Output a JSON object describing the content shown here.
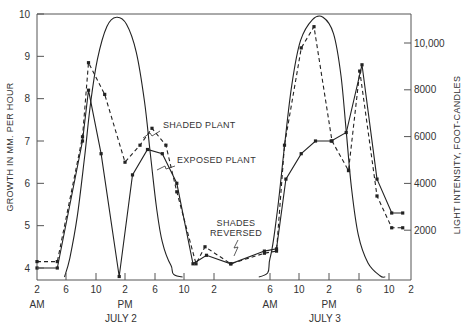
{
  "chart_data": {
    "type": "line",
    "title": "",
    "ylabel": "GROWTH IN MM. PER HOUR",
    "y2label": "LIGHT INTENSITY, FOOT-CANDLES",
    "ylim": [
      4,
      10
    ],
    "y2lim": [
      0,
      11500
    ],
    "yticks": [
      4,
      5,
      6,
      7,
      8,
      9,
      10
    ],
    "y2ticks": [
      {
        "value": 2000,
        "label": "2000"
      },
      {
        "value": 4000,
        "label": "4000"
      },
      {
        "value": 6000,
        "label": "6000"
      },
      {
        "value": 8000,
        "label": "8000"
      },
      {
        "value": 10000,
        "label": "10,000"
      }
    ],
    "xticks": [
      {
        "t": 0,
        "label": "2"
      },
      {
        "t": 4,
        "label": "6"
      },
      {
        "t": 8,
        "label": "10"
      },
      {
        "t": 12,
        "label": "2"
      },
      {
        "t": 16,
        "label": "6"
      },
      {
        "t": 20,
        "label": "10"
      },
      {
        "t": 24,
        "label": "2"
      },
      {
        "t": 28,
        "label": "6"
      },
      {
        "t": 32,
        "label": "10"
      },
      {
        "t": 36,
        "label": "2"
      },
      {
        "t": 40,
        "label": "6"
      },
      {
        "t": 44,
        "label": "10"
      },
      {
        "t": 48,
        "label": "2"
      }
    ],
    "x_sublabels": [
      {
        "t": 0,
        "label": "AM"
      },
      {
        "t": 12,
        "label": "PM"
      },
      {
        "t": 28,
        "label": "AM"
      },
      {
        "t": 36,
        "label": "PM"
      }
    ],
    "x_daylabels": [
      {
        "t": 12,
        "label": "JULY 2"
      },
      {
        "t": 36,
        "label": "JULY 3"
      }
    ],
    "xlabel_units": "hours from 2 AM July 2",
    "grid": false,
    "series": [
      {
        "name": "EXPOSED PLANT",
        "axis": "left",
        "style": "solid",
        "markers": true,
        "points": [
          [
            0,
            4.0
          ],
          [
            2.8,
            4.0
          ],
          [
            6.2,
            7.0
          ],
          [
            7.0,
            8.2
          ],
          [
            8.7,
            6.7
          ],
          [
            11.2,
            3.8
          ],
          [
            13.0,
            6.2
          ],
          [
            15.0,
            6.8
          ],
          [
            17.0,
            6.7
          ],
          [
            19.0,
            6.0
          ],
          [
            21.2,
            4.1
          ],
          [
            23.0,
            4.3
          ],
          [
            25.2,
            4.1
          ],
          [
            27.6,
            4.4
          ],
          [
            28.9,
            4.45
          ],
          [
            30.2,
            6.1
          ],
          [
            32.3,
            6.7
          ],
          [
            34.2,
            7.0
          ],
          [
            36.3,
            7.0
          ],
          [
            38.3,
            7.2
          ],
          [
            40.4,
            8.8
          ],
          [
            42.4,
            6.1
          ],
          [
            44.5,
            5.3
          ],
          [
            46.5,
            5.3
          ]
        ]
      },
      {
        "name": "SHADED PLANT",
        "axis": "left",
        "style": "dashed",
        "markers": true,
        "points": [
          [
            0,
            4.15
          ],
          [
            2.8,
            4.15
          ],
          [
            6.2,
            7.1
          ],
          [
            7.0,
            8.85
          ],
          [
            9.2,
            8.1
          ],
          [
            12.0,
            6.5
          ],
          [
            14.0,
            6.9
          ],
          [
            15.6,
            7.3
          ],
          [
            17.5,
            6.9
          ],
          [
            19.0,
            5.8
          ],
          [
            21.6,
            4.1
          ],
          [
            22.8,
            4.5
          ],
          [
            25.2,
            4.1
          ],
          [
            27.6,
            4.35
          ],
          [
            28.9,
            4.4
          ],
          [
            30.0,
            6.9
          ],
          [
            32.3,
            9.2
          ],
          [
            34.0,
            9.7
          ],
          [
            36.4,
            7.0
          ],
          [
            38.6,
            6.3
          ],
          [
            40.1,
            8.65
          ],
          [
            42.4,
            5.7
          ],
          [
            44.5,
            4.95
          ],
          [
            46.5,
            4.95
          ]
        ]
      },
      {
        "name": "LIGHT INTENSITY",
        "axis": "right",
        "style": "solid",
        "markers": false,
        "points": [
          [
            3.8,
            0
          ],
          [
            4.5,
            800
          ],
          [
            5.5,
            2600
          ],
          [
            6.5,
            5200
          ],
          [
            7.3,
            7500
          ],
          [
            8.2,
            9300
          ],
          [
            9.5,
            10700
          ],
          [
            10.8,
            11100
          ],
          [
            12.2,
            10800
          ],
          [
            13.5,
            9600
          ],
          [
            14.6,
            7500
          ],
          [
            15.4,
            5200
          ],
          [
            16.2,
            3000
          ],
          [
            17.0,
            1500
          ],
          [
            18.2,
            500
          ],
          [
            19.8,
            0
          ],
          [
            27.2,
            0
          ],
          [
            28.0,
            800
          ],
          [
            29.0,
            2800
          ],
          [
            30.0,
            5600
          ],
          [
            31.0,
            8200
          ],
          [
            32.2,
            10100
          ],
          [
            33.8,
            11000
          ],
          [
            35.2,
            11100
          ],
          [
            36.6,
            10400
          ],
          [
            37.6,
            8600
          ],
          [
            38.3,
            6200
          ],
          [
            39.0,
            3800
          ],
          [
            39.9,
            1800
          ],
          [
            41.2,
            600
          ],
          [
            42.8,
            50
          ],
          [
            43.5,
            0
          ]
        ]
      }
    ],
    "annotations": [
      {
        "text": "SHADED PLANT",
        "target_series": "SHADED PLANT"
      },
      {
        "text": "EXPOSED PLANT",
        "target_series": "EXPOSED PLANT"
      },
      {
        "text": "SHADES",
        "line2": "REVERSED"
      }
    ]
  }
}
